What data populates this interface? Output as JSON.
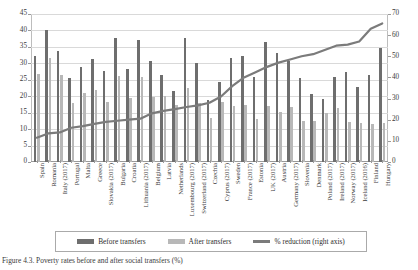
{
  "figure": {
    "caption": "Figure 4.3. Poverty rates before and after social transfers (%)"
  },
  "legend": {
    "position": "bottom",
    "items": [
      {
        "label": "Before transfers",
        "type": "bar",
        "color": "#6e6e6e"
      },
      {
        "label": "After transfers",
        "type": "bar",
        "color": "#b8b8b8"
      },
      {
        "label": "% reduction (right axis)",
        "type": "line",
        "color": "#7b7b7b"
      }
    ]
  },
  "chart_data": {
    "type": "bar",
    "title": "",
    "xlabel": "",
    "ylabel": "",
    "y2label": "",
    "grid": true,
    "ylim": [
      0,
      45
    ],
    "y2lim": [
      0,
      70
    ],
    "yticks": [
      0,
      5,
      10,
      15,
      20,
      25,
      30,
      35,
      40,
      45
    ],
    "y2ticks": [
      0,
      10,
      20,
      30,
      40,
      50,
      60,
      70
    ],
    "categories": [
      "Spain",
      "Romania",
      "Italy (2017)",
      "Portugal",
      "Malta",
      "Greece",
      "Slovakia (2017)",
      "Bulgaria",
      "Croatia",
      "Lithuania (2017)",
      "Belgium",
      "Latvia",
      "Netherlands",
      "Luxembourg (2017)",
      "Switzerland (2017)",
      "Czechia",
      "Cyprus (2017)",
      "Sweden",
      "France (2017)",
      "Estonia",
      "UK (2017)",
      "Austria",
      "Germany (2017)",
      "Slovenia",
      "Denmark",
      "Poland (2017)",
      "Ireland (2017)",
      "Norway (2017)",
      "Iceland (2016)",
      "Finland",
      "Hungary"
    ],
    "series": [
      {
        "name": "Before transfers",
        "axis": "left",
        "color": "#6e6e6e",
        "values": [
          32.3,
          40.0,
          33.8,
          25.5,
          28.8,
          31.2,
          27.6,
          37.6,
          28.4,
          37.2,
          30.6,
          26.6,
          21.6,
          37.6,
          30.1,
          18.9,
          24.3,
          31.5,
          32.1,
          25.9,
          36.5,
          33.1,
          30.8,
          25.5,
          20.6,
          19.2,
          25.8,
          27.4,
          22.8,
          26.5,
          34.6
        ]
      },
      {
        "name": "After transfers",
        "axis": "left",
        "color": "#b8b8b8",
        "values": [
          26.9,
          31.6,
          26.4,
          18.0,
          21.1,
          22.0,
          18.2,
          26.3,
          19.6,
          25.9,
          19.8,
          20.0,
          17.2,
          22.5,
          18.0,
          13.5,
          18.1,
          16.9,
          17.2,
          13.2,
          17.1,
          15.1,
          16.7,
          12.4,
          12.5,
          14.8,
          16.5,
          12.3,
          11.8,
          11.7,
          12.0
        ]
      },
      {
        "name": "% reduction (right axis)",
        "axis": "right",
        "color": "#7b7b7b",
        "values": [
          11.5,
          13.5,
          14.0,
          16.2,
          17.0,
          18.0,
          19.0,
          19.5,
          20.0,
          20.5,
          23.0,
          24.2,
          25.0,
          26.0,
          26.8,
          28.0,
          31.0,
          36.0,
          40.0,
          42.5,
          45.0,
          47.0,
          48.5,
          50.0,
          51.0,
          53.0,
          55.0,
          55.5,
          57.0,
          63.0,
          65.5
        ]
      }
    ]
  }
}
